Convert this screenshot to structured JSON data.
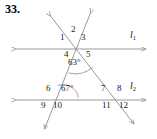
{
  "problem": {
    "number": "33."
  },
  "figure": {
    "type": "geometry-diagram",
    "stroke_color": "#8c8c8c",
    "text_color": "#1a1a1a",
    "lines": [
      {
        "name": "l1",
        "label": "l",
        "subscript": "1",
        "y": 49,
        "x_start": 14,
        "x_end": 148
      },
      {
        "name": "l2",
        "label": "l",
        "subscript": "2",
        "y": 100,
        "x_start": 14,
        "x_end": 148
      }
    ],
    "transversals": [
      {
        "name": "transversal-a",
        "x1": 92,
        "y1": 11,
        "x2": 43,
        "y2": 131
      },
      {
        "name": "transversal-b",
        "x1": 49,
        "y1": 14,
        "x2": 136,
        "y2": 126
      }
    ],
    "angle_labels": [
      {
        "name": "angle-1",
        "text": "1",
        "x": 62,
        "y": 39
      },
      {
        "name": "angle-2",
        "text": "2",
        "x": 73,
        "y": 31
      },
      {
        "name": "angle-3",
        "text": "3",
        "x": 82,
        "y": 39
      },
      {
        "name": "angle-4",
        "text": "4",
        "x": 65,
        "y": 51
      },
      {
        "name": "angle-5",
        "text": "5",
        "x": 85,
        "y": 51
      },
      {
        "name": "angle-6",
        "text": "6",
        "x": 48,
        "y": 88
      },
      {
        "name": "angle-7",
        "text": "7",
        "x": 103,
        "y": 88
      },
      {
        "name": "angle-8",
        "text": "8",
        "x": 119,
        "y": 88
      },
      {
        "name": "angle-9",
        "text": "9",
        "x": 44,
        "y": 102
      },
      {
        "name": "angle-10",
        "text": "10",
        "x": 56,
        "y": 102
      },
      {
        "name": "angle-11",
        "text": "11",
        "x": 105,
        "y": 102
      },
      {
        "name": "angle-12",
        "text": "12",
        "x": 122,
        "y": 102
      }
    ],
    "angle_measures": [
      {
        "name": "angle-measure-63",
        "text": "63°",
        "x": 71,
        "y": 60,
        "vertex_x": 78,
        "vertex_y": 49
      },
      {
        "name": "angle-measure-67",
        "text": "67°",
        "x": 64,
        "y": 88,
        "vertex_x": 62,
        "vertex_y": 100
      }
    ],
    "line_labels": [
      {
        "name": "line-label-l1",
        "letter": "l",
        "sub": "1",
        "x": 131,
        "y": 34
      },
      {
        "name": "line-label-l2",
        "letter": "l",
        "sub": "2",
        "x": 131,
        "y": 85
      }
    ]
  }
}
